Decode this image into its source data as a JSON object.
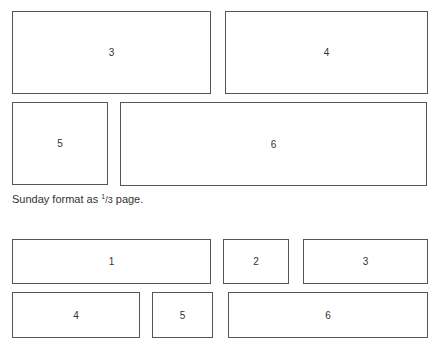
{
  "top_layout": {
    "boxes": [
      {
        "label": "3",
        "x": 12,
        "y": 11,
        "w": 199,
        "h": 83
      },
      {
        "label": "4",
        "x": 225,
        "y": 11,
        "w": 203,
        "h": 83
      },
      {
        "label": "5",
        "x": 12,
        "y": 102,
        "w": 96,
        "h": 83
      },
      {
        "label": "6",
        "x": 120,
        "y": 102,
        "w": 307,
        "h": 84
      }
    ]
  },
  "caption": {
    "before": "Sunday format as ",
    "frac_num": "1",
    "frac_den": "/3",
    "after": " page."
  },
  "bottom_layout": {
    "boxes": [
      {
        "label": "1",
        "x": 12,
        "y": 239,
        "w": 199,
        "h": 45
      },
      {
        "label": "2",
        "x": 223,
        "y": 239,
        "w": 66,
        "h": 45
      },
      {
        "label": "3",
        "x": 303,
        "y": 239,
        "w": 125,
        "h": 45
      },
      {
        "label": "4",
        "x": 12,
        "y": 292,
        "w": 128,
        "h": 46
      },
      {
        "label": "5",
        "x": 152,
        "y": 292,
        "w": 61,
        "h": 46
      },
      {
        "label": "6",
        "x": 228,
        "y": 292,
        "w": 200,
        "h": 46
      }
    ]
  }
}
